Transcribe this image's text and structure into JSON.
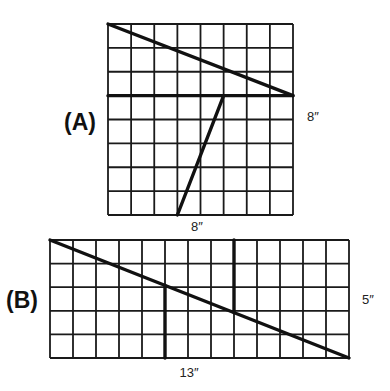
{
  "figures": [
    {
      "id": "A",
      "label": "(A)",
      "cols": 8,
      "rows": 8,
      "box": {
        "x": 108,
        "y": 24,
        "w": 185,
        "h": 191
      },
      "label_pos": {
        "x": 64,
        "y": 130
      },
      "width_label": "8″",
      "width_label_pos": {
        "x": 197,
        "y": 231
      },
      "height_label": "8″",
      "height_label_pos": {
        "x": 307,
        "y": 121
      },
      "cuts": [
        {
          "name": "cut-diagonal-top",
          "from": [
            0,
            0
          ],
          "to": [
            8,
            3
          ]
        },
        {
          "name": "cut-horizontal",
          "from": [
            0,
            3
          ],
          "to": [
            8,
            3
          ]
        },
        {
          "name": "cut-diagonal-bottom",
          "from": [
            5,
            3
          ],
          "to": [
            3,
            8
          ]
        }
      ]
    },
    {
      "id": "B",
      "label": "(B)",
      "cols": 13,
      "rows": 5,
      "box": {
        "x": 50,
        "y": 240,
        "w": 299,
        "h": 118
      },
      "label_pos": {
        "x": 6,
        "y": 308
      },
      "width_label": "13″",
      "width_label_pos": {
        "x": 189,
        "y": 377
      },
      "height_label": "5″",
      "height_label_pos": {
        "x": 362,
        "y": 304
      },
      "cuts": [
        {
          "name": "cut-long-diagonal",
          "from": [
            0,
            0
          ],
          "to": [
            13,
            5
          ]
        },
        {
          "name": "cut-vertical-left",
          "from": [
            5,
            1.923
          ],
          "to": [
            5,
            5
          ]
        },
        {
          "name": "cut-vertical-right",
          "from": [
            8,
            0
          ],
          "to": [
            8,
            3.077
          ]
        }
      ]
    }
  ]
}
